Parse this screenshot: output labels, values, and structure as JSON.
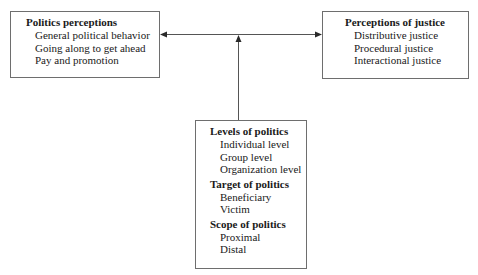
{
  "diagram": {
    "left_box": {
      "title": "Politics perceptions",
      "items": [
        "General political behavior",
        "Going along to get ahead",
        "Pay and promotion"
      ]
    },
    "right_box": {
      "title": "Perceptions of justice",
      "items": [
        "Distributive justice",
        "Procedural justice",
        "Interactional justice"
      ]
    },
    "bottom_box": {
      "groups": [
        {
          "title": "Levels of politics",
          "items": [
            "Individual level",
            "Group level",
            "Organization level"
          ]
        },
        {
          "title": "Target of politics",
          "items": [
            "Beneficiary",
            "Victim"
          ]
        },
        {
          "title": "Scope of politics",
          "items": [
            "Proximal",
            "Distal"
          ]
        }
      ]
    },
    "connections": [
      {
        "from": "bottom_box",
        "to": "horizontal_link",
        "type": "arrow"
      },
      {
        "from": "left_box",
        "to": "right_box",
        "type": "bidirectional-arrow"
      }
    ]
  }
}
